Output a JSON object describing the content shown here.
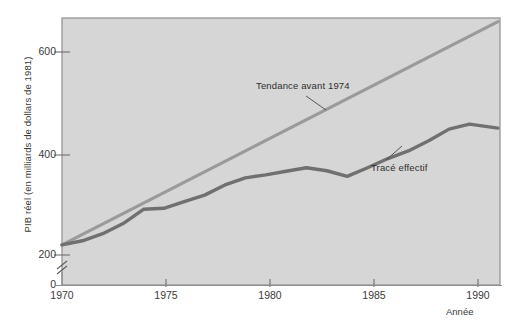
{
  "axes": {
    "ylabel": "PIB réel (en milliards de dollars de 1981)",
    "xlabel": "Année",
    "yticks": [
      "0",
      "200",
      "400",
      "600"
    ],
    "xticks": [
      "1970",
      "1975",
      "1980",
      "1985",
      "1990"
    ],
    "axis_break": "broken-y-axis-mark"
  },
  "annotations": {
    "trend": "Tendance avant 1974",
    "actual": "Tracé effectif"
  },
  "colors": {
    "plot_background": "#d6d6d6",
    "frame": "#8e8e8e",
    "trend_line": "#9a9a9a",
    "actual_line": "#707070",
    "text": "#3a3a3a",
    "page_background": "#ffffff"
  },
  "chart_data": {
    "type": "line",
    "title": "",
    "xlabel": "Année",
    "ylabel": "PIB réel (en milliards de dollars de 1981)",
    "xlim": [
      1970,
      1991.5
    ],
    "ylim": [
      200,
      660
    ],
    "y_axis_broken_below": 200,
    "grid": false,
    "legend": "annotated-inline",
    "series": [
      {
        "name": "Tracé effectif",
        "color": "#707070",
        "x": [
          1970,
          1971,
          1972,
          1973,
          1974,
          1975,
          1976,
          1977,
          1978,
          1979,
          1980,
          1981,
          1982,
          1983,
          1984,
          1985,
          1986,
          1987,
          1988,
          1989,
          1990,
          1991.4
        ],
        "values": [
          220,
          228,
          242,
          262,
          290,
          292,
          305,
          318,
          338,
          352,
          358,
          365,
          372,
          366,
          355,
          372,
          390,
          405,
          425,
          448,
          458,
          450
        ]
      },
      {
        "name": "Tendance avant 1974",
        "color": "#9a9a9a",
        "x": [
          1970,
          1991.4
        ],
        "values": [
          220,
          660
        ]
      }
    ]
  }
}
